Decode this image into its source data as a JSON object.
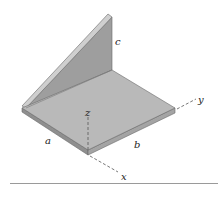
{
  "figure": {
    "labels": {
      "a": "a",
      "b": "b",
      "c": "c",
      "x": "x",
      "y": "y",
      "z": "z"
    },
    "colors": {
      "base_top": "#b9b9b9",
      "base_edge": "#8f8f8f",
      "web_face": "#9e9e9e",
      "web_edge": "#c8c8c8",
      "outline": "#6a6a6a",
      "axis_dash": "#555555",
      "rule": "#9a9a9a"
    }
  }
}
